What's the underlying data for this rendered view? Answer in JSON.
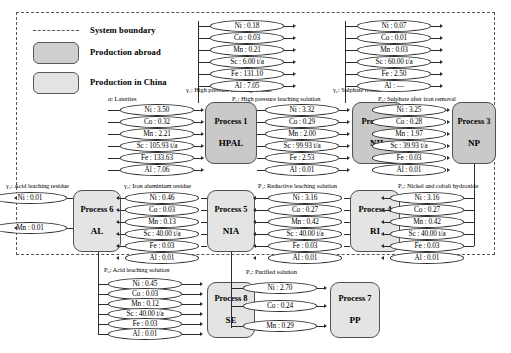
{
  "legend": {
    "boundary_label": "System boundary",
    "abroad_label": "Production abroad",
    "china_label": "Production in China"
  },
  "processes": [
    {
      "id": "p1",
      "num": "Process 1",
      "abbr": "HPAL",
      "region": "abroad"
    },
    {
      "id": "p2",
      "num": "Process 2",
      "abbr": "NIL",
      "region": "abroad"
    },
    {
      "id": "p3",
      "num": "Process 3",
      "abbr": "NP",
      "region": "abroad"
    },
    {
      "id": "p4",
      "num": "Process 4",
      "abbr": "RI",
      "region": "china"
    },
    {
      "id": "p5",
      "num": "Process 5",
      "abbr": "NIA",
      "region": "china"
    },
    {
      "id": "p6",
      "num": "Process 6",
      "abbr": "AL",
      "region": "china"
    },
    {
      "id": "p7",
      "num": "Process 7",
      "abbr": "PP",
      "region": "china"
    },
    {
      "id": "p8",
      "num": "Process 8",
      "abbr": "SE",
      "region": "china"
    }
  ],
  "flows": {
    "alpha": {
      "symbol": "α",
      "sub": "",
      "name": "Laterites",
      "label": "α: Laterites",
      "items": [
        "Ni : 3.50",
        "Co : 0.32",
        "Mn : 2.21",
        "Sc : 105.93 t/a",
        "Fe : 133.63",
        "Al : 7.06"
      ]
    },
    "gamma1": {
      "symbol": "γ",
      "sub": "1",
      "name": "High pressure leaching residue",
      "label": "γ₁: High pressure leaching residue",
      "items": [
        "Ni : 0.18",
        "Co : 0.03",
        "Mn : 0.21",
        "Sc : 6.00 t/a",
        "Fe : 131.10",
        "Al : 7.05"
      ]
    },
    "p1flow": {
      "symbol": "P",
      "sub": "1",
      "name": "High pressure leaching solution",
      "label": "P₁: High pressure leaching solution",
      "items": [
        "Ni : 3.32",
        "Co : 0.29",
        "Mn : 2.00",
        "Sc : 99.93 t/a",
        "Fe : 2.53",
        "Al : 0.01"
      ]
    },
    "gamma2": {
      "symbol": "γ",
      "sub": "2",
      "name": "Sulphate residue",
      "label": "γ₂: Sulphate residue",
      "items": [
        "Ni : 0.07",
        "Co : 0.01",
        "Mn : 0.03",
        "Sc : 60.00 t/a",
        "Fe : 2.50",
        "Al : —"
      ]
    },
    "p2flow": {
      "symbol": "P",
      "sub": "2",
      "name": "Sulphate after iron removal",
      "label": "P₂: Sulphate after iron removal",
      "items": [
        "Ni : 3.25",
        "Co : 0.28",
        "Mn : 1.97",
        "Sc : 39.93 t/a",
        "Fe : 0.03",
        "Al : 0.01"
      ]
    },
    "p3flow": {
      "symbol": "P",
      "sub": "3",
      "name": "Nickel and cobalt hydroxide",
      "label": "P₃: Nickel and cobalt hydroxide",
      "items": [
        "Ni : 3.16",
        "Co : 0.27",
        "Mn : 0.42",
        "Sc : 40.00 t/a",
        "Fe : 0.03",
        "Al : 0.01"
      ]
    },
    "p4flow": {
      "symbol": "P",
      "sub": "4",
      "name": "Reductive leaching solution",
      "label": "P₄: Reductive leaching solution",
      "items": [
        "Ni : 3.16",
        "Co : 0.27",
        "Mn : 0.42",
        "Sc : 40.00 t/a",
        "Fe : 0.03",
        "Al : 0.01"
      ]
    },
    "p5flow": {
      "symbol": "γ",
      "sub": "3",
      "name": "Iron aluminium residue",
      "label": "γ₃: Iron aluminium residue",
      "items": [
        "Ni : 0.46",
        "Co : 0.03",
        "Mn : 0.13",
        "Sc : 40.00 t/a",
        "Fe : 0.03",
        "Al : 0.01"
      ]
    },
    "gamma4": {
      "symbol": "γ",
      "sub": "4",
      "name": "Acid leaching residue",
      "label": "γ₄: Acid leaching residue",
      "items": [
        "Ni : 0.01",
        "Mn : 0.01"
      ]
    },
    "p6flow": {
      "symbol": "P",
      "sub": "6",
      "name": "Acid leaching solution",
      "label": "P₆: Acid leaching solution",
      "items": [
        "Ni : 0.45",
        "Co : 0.03",
        "Mn : 0.12",
        "Sc : 40.00 t/a",
        "Fe : 0.03",
        "Al : 0.01"
      ]
    },
    "p7flow": {
      "symbol": "P",
      "sub": "7",
      "name": "Purified solution",
      "label": "P₇: Purified solution",
      "items": [
        "Ni : 2.70",
        "Co : 0.24",
        "Mn : 0.29"
      ]
    }
  },
  "colors": {
    "abroad_fill": "#c9c9c9",
    "china_fill": "#e4e4e4",
    "stroke": "#2b2b2b"
  }
}
